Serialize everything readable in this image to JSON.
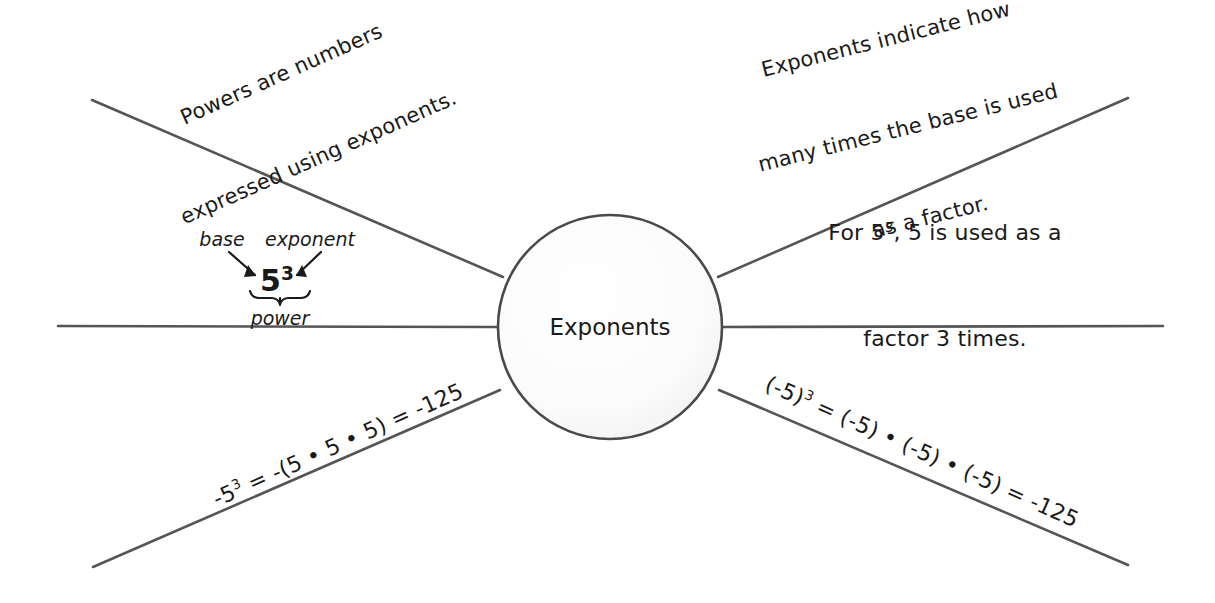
{
  "diagram": {
    "type": "mind-map",
    "title": "Exponents",
    "center_node": {
      "label": "Exponents",
      "shape": "circle",
      "fill": "#fbfbfb",
      "stroke": "#4a4a4a"
    },
    "stroke_color": "#555555",
    "background": "#ffffff",
    "branches": [
      {
        "id": "top-left",
        "position": "upper-left",
        "lines": [
          "Powers are numbers",
          "expressed using exponents."
        ],
        "full_text": "Powers are numbers expressed using exponents.",
        "rotation_deg": -24
      },
      {
        "id": "top-right",
        "position": "upper-right",
        "lines": [
          "Exponents indicate how",
          "many times the base is used",
          "as a factor."
        ],
        "full_text": "Exponents indicate how many times the base is used as a factor.",
        "rotation_deg": -14
      },
      {
        "id": "right-middle",
        "position": "right",
        "lines_html": [
          "For 5<sup>3</sup>, 5 is used as a",
          "factor 3 times."
        ],
        "full_text": "For 5^3, 5 is used as a factor 3 times.",
        "rotation_deg": 0
      },
      {
        "id": "bottom-left",
        "position": "lower-left",
        "line_html": "-5<sup>3</sup> = -(5 • 5 • 5) = -125",
        "full_text": "-5^3 = -(5 • 5 • 5) = -125",
        "rotation_deg": -24
      },
      {
        "id": "bottom-right",
        "position": "lower-right",
        "line_html": "(-5)<sup>3</sup> = (-5) • (-5) • (-5) = -125",
        "full_text": "(-5)^3 = (-5) • (-5) • (-5) = -125",
        "rotation_deg": 24
      },
      {
        "id": "left-middle",
        "position": "left",
        "full_text": "",
        "rotation_deg": 0
      }
    ]
  },
  "annotation": {
    "base_label": "base",
    "exponent_label": "exponent",
    "power_label": "power",
    "expression_html": "5<sup>3</sup>",
    "expression_text": "5^3"
  }
}
